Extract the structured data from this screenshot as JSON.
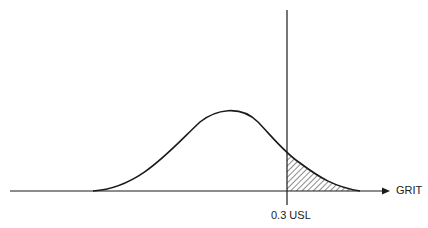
{
  "diagram": {
    "type": "normal-distribution-with-spec-limit",
    "x_axis_label": "GRIT",
    "limit_label": "0.3 USL",
    "limit_value": 0.3,
    "shaded_region": "area under curve beyond USL (hatched)",
    "colors": {
      "line": "#1a1a1a",
      "background": "#ffffff"
    }
  }
}
